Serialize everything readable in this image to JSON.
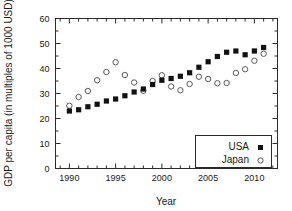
{
  "chart_data": {
    "type": "scatter",
    "title": "",
    "xlabel": "Year",
    "ylabel": "GDP per capita (in multiples of 1000 USD)",
    "xlim": [
      1988.5,
      2012.5
    ],
    "ylim": [
      0,
      60
    ],
    "xticks": [
      1990,
      1995,
      2000,
      2005,
      2010
    ],
    "yticks": [
      0,
      10,
      20,
      30,
      40,
      50,
      60
    ],
    "xtick_labels": [
      "1990",
      "1995",
      "2000",
      "2005",
      "2010"
    ],
    "ytick_labels": [
      "0",
      "10",
      "20",
      "30",
      "40",
      "50",
      "60"
    ],
    "minor_ticks": true,
    "grid": false,
    "legend_position": "lower-right",
    "x": [
      1990,
      1991,
      1992,
      1993,
      1994,
      1995,
      1996,
      1997,
      1998,
      1999,
      2000,
      2001,
      2002,
      2003,
      2004,
      2005,
      2006,
      2007,
      2008,
      2009,
      2010,
      2011
    ],
    "series": [
      {
        "name": "USA",
        "marker": "filled-square",
        "color": "#111111",
        "values": [
          23.0,
          23.5,
          24.7,
          25.7,
          27.0,
          27.8,
          29.1,
          30.6,
          31.8,
          33.6,
          35.3,
          36.0,
          36.9,
          38.3,
          40.5,
          42.7,
          44.8,
          46.5,
          47.0,
          45.5,
          47.0,
          48.4
        ]
      },
      {
        "name": "Japan",
        "marker": "open-circle",
        "color": "#5a5a5a",
        "values": [
          25.1,
          28.6,
          31.0,
          35.3,
          38.6,
          42.5,
          37.4,
          34.4,
          31.1,
          35.0,
          37.3,
          32.8,
          31.3,
          33.8,
          36.7,
          35.8,
          34.1,
          34.2,
          38.2,
          39.7,
          43.1,
          45.9
        ]
      }
    ]
  },
  "legend": {
    "entries": [
      {
        "label": "USA"
      },
      {
        "label": "Japan"
      }
    ]
  }
}
